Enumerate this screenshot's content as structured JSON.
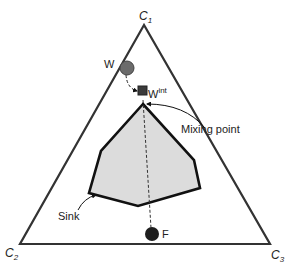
{
  "diagram": {
    "type": "ternary-mixing-diagram",
    "vertices": {
      "top": {
        "label": "C",
        "sub": "1"
      },
      "bottom_left": {
        "label": "C",
        "sub": "2"
      },
      "bottom_right": {
        "label": "C",
        "sub": "3"
      }
    },
    "points": {
      "w": {
        "label": "W",
        "shape": "circle",
        "color": "#6b6b6b"
      },
      "w_int": {
        "label": "W",
        "sup": "int",
        "shape": "square",
        "color": "#3a3a3a"
      },
      "f": {
        "label": "F",
        "shape": "circle",
        "color": "#1e1e1e"
      }
    },
    "annotations": {
      "mixing_point": "Mixing point",
      "sink": "Sink"
    },
    "colors": {
      "triangle": "#333333",
      "sink_fill": "#dcdcdc",
      "sink_stroke": "#111111"
    }
  }
}
